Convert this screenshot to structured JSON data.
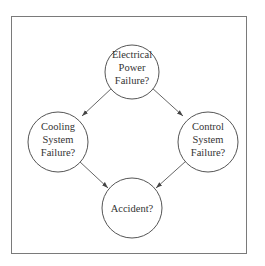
{
  "diagram": {
    "type": "bayesian-network",
    "nodes": [
      {
        "id": "power",
        "lines": [
          "Electrical",
          "Power",
          "Failure?"
        ]
      },
      {
        "id": "cooling",
        "lines": [
          "Cooling",
          "System",
          "Failure?"
        ]
      },
      {
        "id": "control",
        "lines": [
          "Control",
          "System",
          "Failure?"
        ]
      },
      {
        "id": "accident",
        "lines": [
          "Accident?"
        ]
      }
    ],
    "edges": [
      {
        "from": "power",
        "to": "cooling"
      },
      {
        "from": "power",
        "to": "control"
      },
      {
        "from": "cooling",
        "to": "accident"
      },
      {
        "from": "control",
        "to": "accident"
      }
    ]
  }
}
